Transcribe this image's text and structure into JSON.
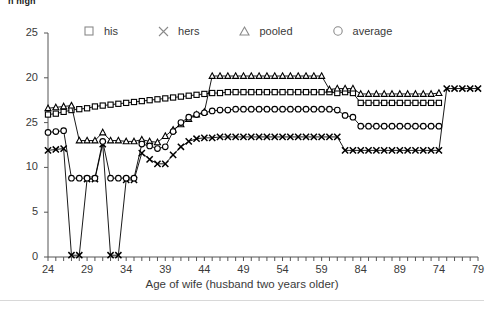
{
  "header": {
    "clipped_text": "n high"
  },
  "legend": {
    "position": "top",
    "items": [
      {
        "marker": "square-marker-icon",
        "label": "his"
      },
      {
        "marker": "x-marker-icon",
        "label": "hers"
      },
      {
        "marker": "triangle-marker-icon",
        "label": "pooled"
      },
      {
        "marker": "circle-marker-icon",
        "label": "average"
      }
    ]
  },
  "footer": {
    "divider": "horizontal-rule"
  },
  "chart_data": {
    "type": "line",
    "title": "",
    "subtitle": "",
    "xlabel": "Age of wife (husband two years older)",
    "ylabel": "",
    "xlim": [
      24,
      79
    ],
    "ylim": [
      0,
      25
    ],
    "grid": false,
    "legend_position": "top",
    "x_tick_labels": [
      "24",
      "29",
      "34",
      "39",
      "44",
      "49",
      "54",
      "59",
      "84",
      "89",
      "74",
      "79"
    ],
    "x_tick_values": [
      24,
      29,
      34,
      39,
      44,
      49,
      54,
      59,
      64,
      69,
      74,
      79
    ],
    "x_minor_tick_step": 1,
    "y_tick_labels": [
      "25",
      "20",
      "25",
      "10",
      "5",
      "0"
    ],
    "y_tick_values": [
      25,
      20,
      15,
      10,
      5,
      0
    ],
    "note_axis_labels": "Third y-label reads 25 and x-labels read 84, 89 as printed in the original figure",
    "x": [
      24,
      25,
      26,
      27,
      28,
      29,
      30,
      31,
      32,
      33,
      34,
      35,
      36,
      37,
      38,
      39,
      40,
      41,
      42,
      43,
      44,
      45,
      46,
      47,
      48,
      49,
      50,
      51,
      52,
      53,
      54,
      55,
      56,
      57,
      58,
      59,
      60,
      61,
      62,
      63,
      64,
      65,
      66,
      67,
      68,
      69,
      70,
      71,
      72,
      73,
      74,
      75,
      76,
      77,
      78,
      79
    ],
    "series": [
      {
        "name": "his",
        "marker": "square",
        "values": [
          15.9,
          16.0,
          16.2,
          16.4,
          16.5,
          16.6,
          16.8,
          16.9,
          17.0,
          17.1,
          17.2,
          17.3,
          17.4,
          17.5,
          17.6,
          17.7,
          17.8,
          17.9,
          18.0,
          18.1,
          18.2,
          18.3,
          18.3,
          18.4,
          18.4,
          18.4,
          18.4,
          18.4,
          18.4,
          18.4,
          18.4,
          18.4,
          18.4,
          18.4,
          18.4,
          18.4,
          18.4,
          18.3,
          18.4,
          18.3,
          17.2,
          17.2,
          17.2,
          17.2,
          17.2,
          17.2,
          17.2,
          17.2,
          17.2,
          17.2,
          17.2,
          null,
          null,
          null,
          null,
          null
        ]
      },
      {
        "name": "hers",
        "marker": "x",
        "values": [
          11.9,
          12.0,
          12.1,
          0.2,
          0.2,
          8.7,
          8.7,
          12.6,
          0.2,
          0.2,
          8.6,
          8.6,
          11.6,
          10.9,
          10.4,
          10.4,
          11.4,
          12.3,
          12.9,
          13.2,
          13.3,
          13.3,
          13.4,
          13.4,
          13.4,
          13.4,
          13.4,
          13.4,
          13.4,
          13.4,
          13.4,
          13.4,
          13.4,
          13.4,
          13.4,
          13.4,
          13.4,
          13.4,
          11.9,
          11.9,
          11.9,
          11.9,
          11.9,
          11.9,
          11.9,
          11.9,
          11.9,
          11.9,
          11.9,
          11.9,
          11.9,
          18.8,
          18.8,
          18.8,
          18.8,
          18.8
        ]
      },
      {
        "name": "pooled",
        "marker": "triangle",
        "values": [
          16.6,
          16.7,
          16.8,
          16.9,
          13.0,
          13.0,
          13.0,
          13.9,
          13.0,
          13.0,
          12.9,
          12.9,
          13.1,
          12.9,
          12.8,
          13.5,
          14.2,
          14.8,
          15.4,
          15.9,
          16.2,
          20.2,
          20.2,
          20.2,
          20.2,
          20.2,
          20.2,
          20.2,
          20.2,
          20.2,
          20.2,
          20.2,
          20.2,
          20.2,
          20.2,
          20.2,
          18.7,
          18.8,
          18.8,
          18.8,
          18.2,
          18.2,
          18.2,
          18.2,
          18.2,
          18.2,
          18.2,
          18.2,
          18.2,
          18.2,
          18.3,
          null,
          null,
          null,
          null,
          null
        ]
      },
      {
        "name": "average",
        "marker": "circle",
        "values": [
          13.9,
          14.0,
          14.1,
          8.8,
          8.8,
          8.8,
          8.8,
          12.9,
          8.8,
          8.8,
          8.8,
          8.8,
          12.6,
          12.4,
          12.1,
          12.3,
          14.0,
          15.0,
          15.6,
          15.9,
          16.1,
          16.3,
          16.4,
          16.4,
          16.5,
          16.5,
          16.5,
          16.5,
          16.5,
          16.5,
          16.5,
          16.5,
          16.5,
          16.5,
          16.5,
          16.5,
          16.5,
          16.4,
          15.8,
          15.6,
          14.6,
          14.6,
          14.6,
          14.6,
          14.6,
          14.6,
          14.6,
          14.6,
          14.6,
          14.6,
          14.6,
          null,
          null,
          null,
          null,
          null
        ]
      }
    ]
  }
}
